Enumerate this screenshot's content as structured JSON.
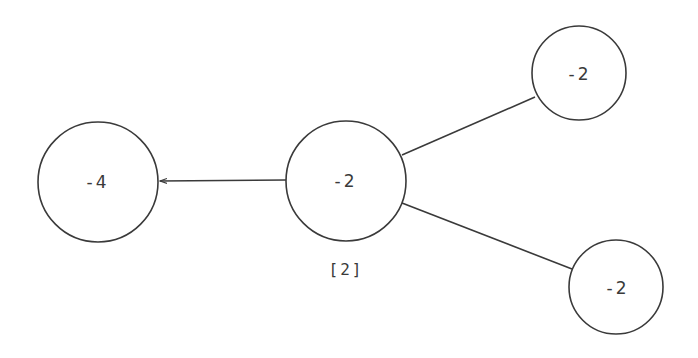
{
  "diagram": {
    "type": "graph",
    "nodes": [
      {
        "id": "left",
        "label": "-4",
        "cx": 98,
        "cy": 182,
        "r": 60
      },
      {
        "id": "center",
        "label": "-2",
        "cx": 346,
        "cy": 181,
        "r": 60,
        "annotation": "[2]"
      },
      {
        "id": "top-right",
        "label": "-2",
        "cx": 579,
        "cy": 73,
        "r": 47
      },
      {
        "id": "bottom-right",
        "label": "-2",
        "cx": 616,
        "cy": 287,
        "r": 47
      }
    ],
    "edges": [
      {
        "from": "center",
        "to": "left",
        "arrow": true
      },
      {
        "from": "center",
        "to": "top-right",
        "arrow": false
      },
      {
        "from": "center",
        "to": "bottom-right",
        "arrow": false
      }
    ],
    "colors": {
      "stroke": "#3a3a3a",
      "background": "#ffffff"
    }
  }
}
